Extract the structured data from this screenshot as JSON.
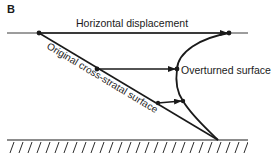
{
  "panel_label": "B",
  "labels": {
    "horizontal_displacement": "Horizontal displacement",
    "overturned_surface": "Overturned surface",
    "original_surface": "Original cross-stratal surface"
  },
  "colors": {
    "ink": "#1a1a1a",
    "thin_line": "#3a3a3a",
    "background": "#ffffff"
  },
  "geometry": {
    "top_line": {
      "x1": 7,
      "x2": 248,
      "y": 33
    },
    "base_line": {
      "x1": 7,
      "x2": 248,
      "y": 140
    },
    "apex": {
      "x": 218,
      "y": 140
    },
    "original_start": {
      "x": 39,
      "y": 33
    },
    "arrows": [
      {
        "from": {
          "x": 39,
          "y": 33
        },
        "to": {
          "x": 229,
          "y": 33
        }
      },
      {
        "from": {
          "x": 97,
          "y": 69
        },
        "to": {
          "x": 177,
          "y": 69
        }
      },
      {
        "from": {
          "x": 158,
          "y": 103
        },
        "to": {
          "x": 183,
          "y": 101
        }
      }
    ]
  }
}
